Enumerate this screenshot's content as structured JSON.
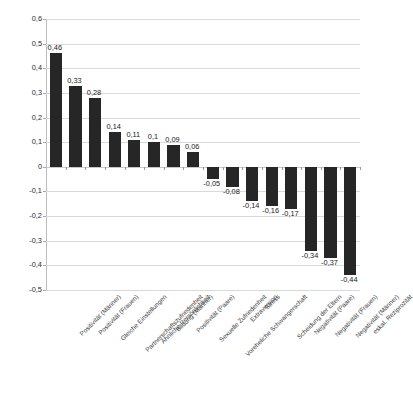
{
  "chart": {
    "title": "",
    "type": "bar"
  },
  "chart_data": {
    "type": "bar",
    "title": "",
    "subtitle": "",
    "xlabel": "",
    "ylabel": "",
    "ylim": [
      -0.5,
      0.6
    ],
    "ytick_step": 0.1,
    "grid": "horizontal",
    "legend": "none",
    "decimal_separator": ",",
    "orientation": "vertical",
    "bar_color": "#262626",
    "background_color": "#ffffff",
    "gridline_color": "#d9d9dd",
    "sorted": "descending",
    "ytick_labels": [
      "0,6",
      "0,5",
      "0,4",
      "0,3",
      "0,2",
      "0,1",
      "0",
      "-0,1",
      "-0,2",
      "-0,3",
      "-0,4",
      "-0,5"
    ],
    "ytick_values": [
      0.6,
      0.5,
      0.4,
      0.3,
      0.2,
      0.1,
      0,
      -0.1,
      -0.2,
      -0.3,
      -0.4,
      -0.5
    ],
    "categories": [
      "Positivität (Männer)",
      "Positivität (Frauen)",
      "Gleiche Einstellungen",
      "Partnerschaftszufriedenheit",
      "Ähnliche Persönlichkeit",
      "Bildung (Männer)",
      "Positivität (Paare)",
      "Sexuelle Zufriedenheit",
      "Voreheliche Schwangerschaft",
      "Extraversion",
      "Stress",
      "Scheidung der Eltern",
      "Negativität (Paare)",
      "Negativität (Frauen)",
      "Negativität (Männer)",
      "eskal. Reziprozität"
    ],
    "values": [
      0.46,
      0.33,
      0.28,
      0.14,
      0.11,
      0.1,
      0.09,
      0.06,
      -0.05,
      -0.08,
      -0.14,
      -0.16,
      -0.17,
      -0.34,
      -0.37,
      -0.44
    ],
    "value_labels": [
      "0,46",
      "0,33",
      "0,28",
      "0,14",
      "0,11",
      "0,1",
      "0,09",
      "0,06",
      "-0,05",
      "-0,08",
      "-0,14",
      "-0,16",
      "-0,17",
      "-0,34",
      "-0,37",
      "-0,44"
    ]
  }
}
